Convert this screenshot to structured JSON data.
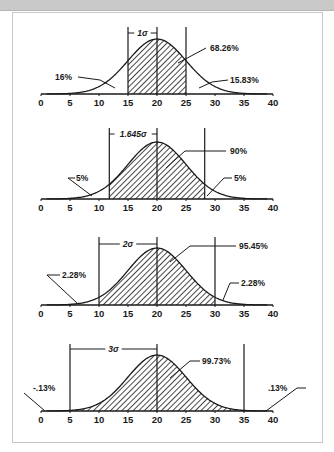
{
  "page": {
    "top_band_color": "#c9c9c9",
    "panel_border_color": "#c8c8c8",
    "ink_color": "#1a1a1a"
  },
  "chart_data": [
    {
      "type": "area",
      "title": "Normal distribution, ±1σ",
      "mean": 20,
      "sigma": 5,
      "x_ticks": [
        "0",
        "5",
        "10",
        "15",
        "20",
        "25",
        "30",
        "35",
        "40"
      ],
      "xlim": [
        0,
        40
      ],
      "shaded_range": [
        15,
        25
      ],
      "bracket_label": "1σ",
      "center_label": "68.26%",
      "left_tail_label": "16%",
      "right_tail_label": "15.83%"
    },
    {
      "type": "area",
      "title": "Normal distribution, ±1.645σ",
      "mean": 20,
      "sigma": 5,
      "x_ticks": [
        "0",
        "5",
        "10",
        "15",
        "20",
        "25",
        "30",
        "35",
        "40"
      ],
      "xlim": [
        0,
        40
      ],
      "shaded_range": [
        11.775,
        28.225
      ],
      "bracket_label": "1.645σ",
      "center_label": "90%",
      "left_tail_label": "5%",
      "right_tail_label": "5%"
    },
    {
      "type": "area",
      "title": "Normal distribution, ±2σ",
      "mean": 20,
      "sigma": 5,
      "x_ticks": [
        "0",
        "5",
        "10",
        "15",
        "20",
        "25",
        "30",
        "35",
        "40"
      ],
      "xlim": [
        0,
        40
      ],
      "shaded_range": [
        10,
        30
      ],
      "bracket_label": "2σ",
      "center_label": "95.45%",
      "left_tail_label": "2.28%",
      "right_tail_label": "2.28%"
    },
    {
      "type": "area",
      "title": "Normal distribution, ±3σ",
      "mean": 20,
      "sigma": 5,
      "x_ticks": [
        "0",
        "5",
        "10",
        "15",
        "20",
        "25",
        "30",
        "35",
        "40"
      ],
      "xlim": [
        0,
        40
      ],
      "shaded_range": [
        5,
        35
      ],
      "bracket_label": "3σ",
      "center_label": "99.73%",
      "left_tail_label": "-.13%",
      "right_tail_label": ".13%"
    }
  ],
  "layout": {
    "x0_px": 41,
    "x40_px": 273,
    "panels": [
      {
        "axis_y": 94,
        "peak_y": 39,
        "line_top": 27,
        "bracket_y": 33,
        "center_leader": [
          [
            206,
            48
          ],
          [
            178,
            63
          ]
        ],
        "center_text_xy": [
          210,
          51
        ],
        "left_leader": [
          [
            78,
            77
          ],
          [
            100,
            80
          ],
          [
            115,
            88
          ]
        ],
        "left_text_xy": [
          55,
          80
        ],
        "right_leader": [
          [
            228,
            80
          ],
          [
            212,
            82
          ],
          [
            199,
            88
          ]
        ],
        "right_text_xy": [
          230,
          83
        ]
      },
      {
        "axis_y": 199,
        "peak_y": 142,
        "line_top": 128,
        "bracket_y": 134,
        "center_leader": [
          [
            226,
            151
          ],
          [
            185,
            151
          ],
          [
            166,
            168
          ]
        ],
        "center_text_xy": [
          230,
          154
        ],
        "left_leader": [
          [
            75,
            178
          ],
          [
            68,
            178
          ],
          [
            92,
            196
          ]
        ],
        "left_text_xy": [
          76,
          181
        ],
        "right_leader": [
          [
            232,
            178
          ],
          [
            224,
            178
          ],
          [
            207,
            196
          ]
        ],
        "right_text_xy": [
          234,
          181
        ]
      },
      {
        "axis_y": 305,
        "peak_y": 248,
        "line_top": 237,
        "bracket_y": 244,
        "center_leader": [
          [
            236,
            246
          ],
          [
            190,
            246
          ],
          [
            170,
            262
          ]
        ],
        "center_text_xy": [
          239,
          249
        ],
        "left_leader": [
          [
            60,
            275
          ],
          [
            47,
            275
          ],
          [
            77,
            303
          ]
        ],
        "left_text_xy": [
          62,
          278
        ],
        "right_leader": [
          [
            239,
            283
          ],
          [
            230,
            283
          ],
          [
            223,
            300
          ]
        ],
        "right_text_xy": [
          241,
          286
        ]
      },
      {
        "axis_y": 411,
        "peak_y": 355,
        "line_top": 344,
        "bracket_y": 349,
        "center_leader": [
          [
            200,
            361
          ],
          [
            190,
            361
          ],
          [
            170,
            378
          ]
        ],
        "center_text_xy": [
          202,
          364
        ],
        "left_leader": [
          [
            24,
            393
          ],
          [
            45,
            411
          ]
        ],
        "left_text_xy": [
          33,
          391
        ],
        "right_leader": [
          [
            306,
            388
          ],
          [
            297,
            388
          ],
          [
            266,
            411
          ]
        ],
        "right_text_xy": [
          268,
          391
        ]
      }
    ]
  }
}
